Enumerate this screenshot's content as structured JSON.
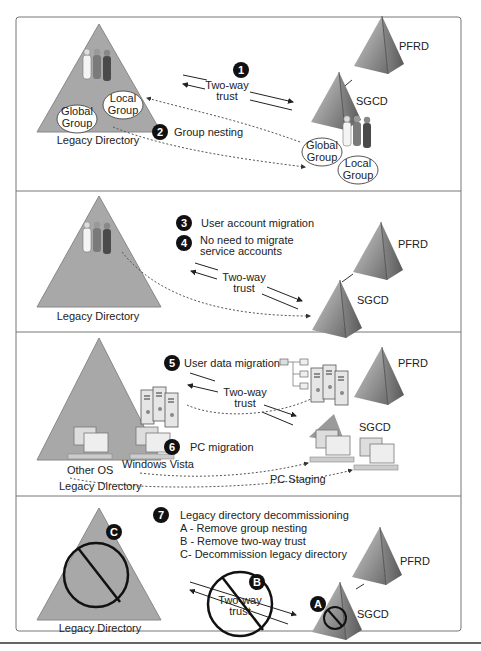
{
  "colors": {
    "triangle_fill": "#a8a8a8",
    "pyramid_dark": "#6a6a6a",
    "pyramid_light": "#c8c8c8",
    "step_badge": "#111111",
    "frame": "#666666"
  },
  "panels": [
    {
      "id": "panel-1",
      "legacy_label": "Legacy Directory",
      "global_group": [
        "Global",
        "Group"
      ],
      "local_group": [
        "Local",
        "Group"
      ],
      "steps": [
        {
          "num": "1",
          "label": ""
        },
        {
          "num": "2",
          "label": "Group nesting"
        }
      ],
      "trust": [
        "Two-way",
        "trust"
      ],
      "pfrd": "PFRD",
      "sgcd": "SGCD",
      "target_global_group": [
        "Global",
        "Group"
      ],
      "target_local_group": [
        "Local",
        "Group"
      ]
    },
    {
      "id": "panel-2",
      "legacy_label": "Legacy Directory",
      "steps": [
        {
          "num": "3",
          "label": "User account migration"
        },
        {
          "num": "4",
          "label": [
            "No need to migrate",
            "service accounts"
          ]
        }
      ],
      "trust": [
        "Two-way",
        "trust"
      ],
      "pfrd": "PFRD",
      "sgcd": "SGCD"
    },
    {
      "id": "panel-3",
      "legacy_label": "Legacy Directory",
      "other_os": "Other OS",
      "windows_vista": "Windows Vista",
      "steps": [
        {
          "num": "5",
          "label": "User data migration"
        },
        {
          "num": "6",
          "label": "PC migration"
        }
      ],
      "trust": [
        "Two-way",
        "trust"
      ],
      "pc_staging": "PC Staging",
      "pfrd": "PFRD",
      "sgcd": "SGCD"
    },
    {
      "id": "panel-4",
      "legacy_label": "Legacy Directory",
      "steps": [
        {
          "num": "7",
          "label": "Legacy directory decommissioning"
        }
      ],
      "substeps": [
        "A - Remove group nesting",
        "B - Remove two-way trust",
        "C- Decommission legacy directory"
      ],
      "badges": {
        "a": "A",
        "b": "B",
        "c": "C"
      },
      "trust": [
        "Two-way",
        "trust"
      ],
      "pfrd": "PFRD",
      "sgcd": "SGCD"
    }
  ]
}
